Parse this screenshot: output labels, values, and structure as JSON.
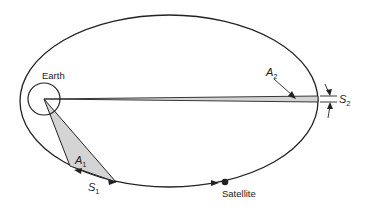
{
  "diagram": {
    "type": "kepler-second-law-orbit",
    "labels": {
      "earth": "Earth",
      "satellite": "Satellite",
      "area1_main": "A",
      "area1_sub": "1",
      "area2_main": "A",
      "area2_sub": "2",
      "arc1_main": "S",
      "arc1_sub": "1",
      "arc2_main": "S",
      "arc2_sub": "2"
    },
    "colors": {
      "stroke": "#222222",
      "shaded_area": "#d4d4d4",
      "background": "#ffffff"
    }
  }
}
